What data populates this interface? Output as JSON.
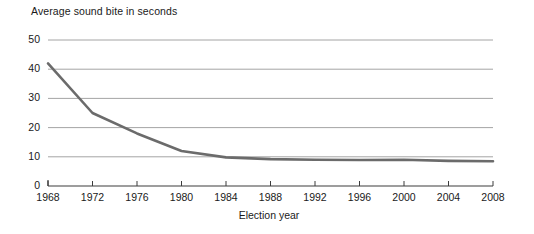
{
  "chart_data": {
    "type": "line",
    "title": "Average sound bite in seconds",
    "xlabel": "Election year",
    "ylabel": "",
    "x": [
      1968,
      1972,
      1976,
      1980,
      1984,
      1988,
      1992,
      1996,
      2000,
      2004,
      2008
    ],
    "values": [
      42.0,
      25.0,
      18.0,
      12.0,
      9.8,
      9.2,
      9.0,
      8.9,
      9.0,
      8.6,
      8.5
    ],
    "categories": [
      "1968",
      "1972",
      "1976",
      "1980",
      "1984",
      "1988",
      "1992",
      "1996",
      "2000",
      "2004",
      "2008"
    ],
    "xlim": [
      1968,
      2008
    ],
    "ylim": [
      0,
      50
    ],
    "yticks": [
      0,
      10,
      20,
      30,
      40,
      50
    ],
    "ytick_labels": [
      "0",
      "10",
      "20",
      "30",
      "40",
      "50"
    ],
    "xticks": [
      1968,
      1972,
      1976,
      1980,
      1984,
      1988,
      1992,
      1996,
      2000,
      2004,
      2008
    ],
    "xtick_labels": [
      "1968",
      "1972",
      "1976",
      "1980",
      "1984",
      "1988",
      "1992",
      "1996",
      "2000",
      "2004",
      "2008"
    ],
    "grid": "horizontal",
    "legend": "none",
    "series": [
      {
        "name": "Average sound bite in seconds",
        "color": "#6b6b6b",
        "values": [
          42.0,
          25.0,
          18.0,
          12.0,
          9.8,
          9.2,
          9.0,
          8.9,
          9.0,
          8.6,
          8.5
        ]
      }
    ],
    "colors": {
      "line": "#6b6b6b",
      "grid": "#9a9a9a",
      "axis": "#3c3c3c",
      "text": "#1a1a1a",
      "background": "#ffffff"
    }
  }
}
